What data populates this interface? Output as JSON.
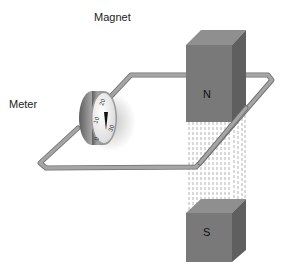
{
  "diagram": {
    "title_labels": {
      "magnet": "Magnet",
      "meter": "Meter"
    },
    "magnets": [
      {
        "pole": "N",
        "position": "top"
      },
      {
        "pole": "S",
        "position": "bottom"
      }
    ],
    "meter": {
      "scale": [
        "0",
        "10",
        "20",
        "30"
      ]
    },
    "components": [
      "wire-loop",
      "meter",
      "north-magnet",
      "south-magnet",
      "magnetic-field-lines"
    ],
    "colors": {
      "magnet_front": "#7a7a7a",
      "magnet_top": "#8e8e8e",
      "magnet_side": "#5f5f5f",
      "wire": "#9c9c9c",
      "wire_shadow": "#6e6e6e",
      "meter_body": "#8a8a8a",
      "meter_face": "#f2f2f2",
      "field_lines": "#9a9a9a",
      "text": "#222222"
    }
  }
}
